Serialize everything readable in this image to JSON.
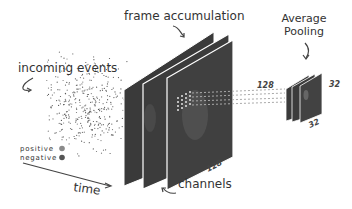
{
  "labels": {
    "incoming_events": "incoming events",
    "frame_accumulation": "frame accumulation",
    "average_pooling_line1": "Average",
    "average_pooling_line2": "Pooling",
    "time": "time",
    "channels": "channels"
  },
  "legend": {
    "positive": "positive",
    "negative": "negative",
    "positive_color": "#8a8a8a",
    "negative_color": "#555555"
  },
  "dimensions": {
    "frame_height": "128",
    "frame_width": "128",
    "pooled_height": "32",
    "pooled_width": "32"
  },
  "colors": {
    "frame_fill": "#3d3d3d",
    "frame_edge": "#ffffff",
    "text": "#333333"
  }
}
